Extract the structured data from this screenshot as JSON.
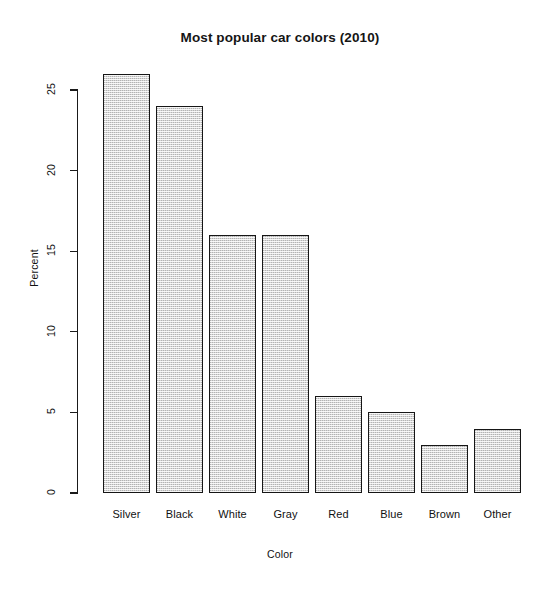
{
  "chart_data": {
    "type": "bar",
    "title": "Most popular car colors (2010)",
    "xlabel": "Color",
    "ylabel": "Percent",
    "categories": [
      "Silver",
      "Black",
      "White",
      "Gray",
      "Red",
      "Blue",
      "Brown",
      "Other"
    ],
    "values": [
      26,
      24,
      16,
      16,
      6,
      5,
      3,
      4
    ],
    "ylim": [
      0,
      26
    ],
    "yticks": [
      0,
      5,
      10,
      15,
      20,
      25
    ],
    "ytick_labels": [
      "0",
      "5",
      "10",
      "15",
      "20",
      "25"
    ],
    "grid": false,
    "legend": null,
    "bar_fill_color": "#d6d6d6",
    "bar_border_color": "#161616",
    "axis_color": "#1a1a1a",
    "background_color": "#ffffff",
    "tick_label_rotation_y": 90,
    "annotations": []
  }
}
